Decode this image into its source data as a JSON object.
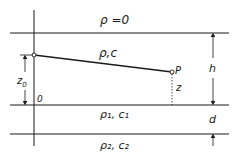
{
  "diagram": {
    "layers": {
      "top": "ρ =0",
      "middle": "ρ,c",
      "lower": "ρ₁, c₁",
      "bottom": "ρ₂, c₂"
    },
    "labels": {
      "origin": "0",
      "point": "P",
      "z0": "z",
      "z0_sub": "0",
      "z": "z",
      "h": "h",
      "d": "d"
    },
    "colors": {
      "line": "#1a1a1a",
      "background": "#ffffff"
    }
  }
}
